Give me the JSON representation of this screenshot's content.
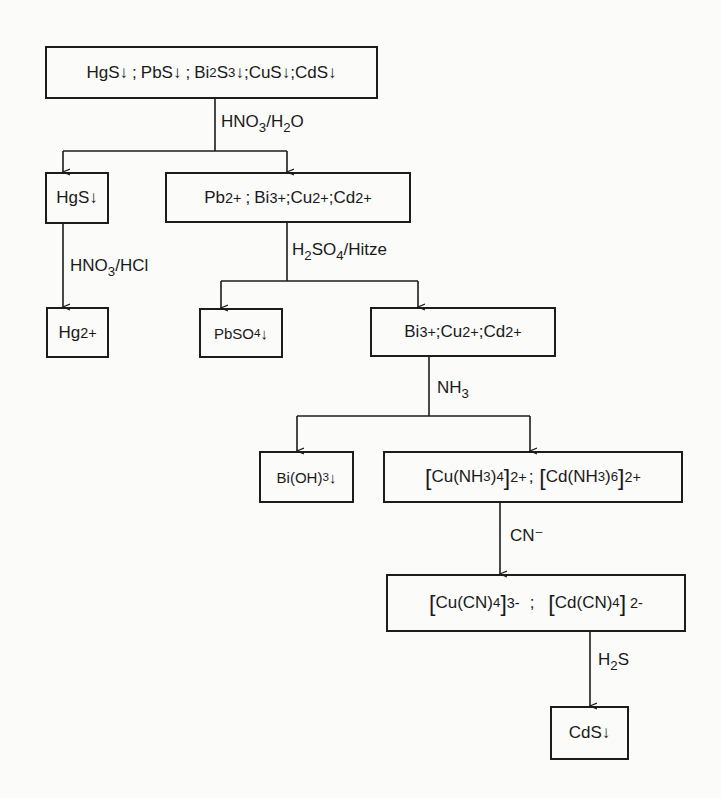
{
  "diagram": {
    "type": "separation-scheme",
    "language": "de",
    "nodes": [
      {
        "id": "start",
        "label": "HgS↓; PbS↓; Bi2S3↓; CuS↓; CdS↓"
      },
      {
        "id": "hgs",
        "label": "HgS↓"
      },
      {
        "id": "cations1",
        "label": "Pb2+; Bi3+; Cu2+; Cd2+"
      },
      {
        "id": "hg",
        "label": "Hg2+"
      },
      {
        "id": "pbso4",
        "label": "PbSO4↓"
      },
      {
        "id": "cations2",
        "label": "Bi3+; Cu2+; Cd2+"
      },
      {
        "id": "bioh3",
        "label": "Bi(OH)3↓"
      },
      {
        "id": "ammine",
        "label": "[Cu(NH3)4]2+; [Cd(NH3)6]2+"
      },
      {
        "id": "cyano",
        "label": "[Cu(CN)4]3-; [Cd(CN)4]2-"
      },
      {
        "id": "cds",
        "label": "CdS↓"
      }
    ],
    "edges": [
      {
        "from": "start",
        "to": [
          "hgs",
          "cations1"
        ],
        "reagent": "HNO3/H2O"
      },
      {
        "from": "hgs",
        "to": [
          "hg"
        ],
        "reagent": "HNO3/HCl"
      },
      {
        "from": "cations1",
        "to": [
          "pbso4",
          "cations2"
        ],
        "reagent": "H2SO4/Hitze"
      },
      {
        "from": "cations2",
        "to": [
          "bioh3",
          "ammine"
        ],
        "reagent": "NH3"
      },
      {
        "from": "ammine",
        "to": [
          "cyano"
        ],
        "reagent": "CN⁻"
      },
      {
        "from": "cyano",
        "to": [
          "cds"
        ],
        "reagent": "H2S"
      }
    ]
  },
  "text": {
    "hgs1": "HgS",
    "pbs": "PbS",
    "bi": "Bi",
    "s": "S",
    "cus": "CuS",
    "cds1": "CdS",
    "arrow": "↓",
    "semi": ";",
    "two": "2",
    "three": "3",
    "four": "4",
    "six": "6",
    "two_plus": "2+",
    "three_plus": "3+",
    "three_minus": "3-",
    "two_minus": "2-",
    "pb": "Pb",
    "cu": "Cu",
    "cd": "Cd",
    "hg": "Hg",
    "pbso": "PbSO",
    "bi_oh": "Bi(OH)",
    "cu_nh": "Cu(NH",
    "cd_nh": "Cd(NH",
    "close_paren": ")",
    "cu_cn": "Cu(CN)",
    "cd_cn": "Cd(CN)",
    "lbr": "[",
    "rbr": "]",
    "hno": "HNO",
    "h2o_h": "/H",
    "o": "O",
    "hcl": "/HCl",
    "h": "H",
    "so": "SO",
    "hitze": "/Hitze",
    "nh": "NH",
    "cn_minus": "CN⁻",
    "cds2": "CdS"
  }
}
